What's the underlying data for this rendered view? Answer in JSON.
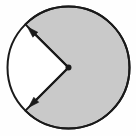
{
  "figure": {
    "type": "geometry-diagram",
    "canvas": {
      "width": 136,
      "height": 136,
      "background_color": "#fefefe"
    },
    "circle": {
      "name": "circle-outline",
      "center_x": 68.5,
      "center_y": 67.5,
      "radius": 61.0,
      "stroke_color": "#1a1a1a",
      "stroke_width": 2.0,
      "fill_color": "#ffffff"
    },
    "shaded_sector": {
      "name": "shaded-reflex-sector",
      "fill_color": "#c9c9c9",
      "stroke_color": "#1a1a1a",
      "stroke_width": 2.0,
      "start_angle_deg": 135,
      "end_angle_deg": 225,
      "sweep_deg": 270,
      "description": "major (reflex) sector swept clockwise from the upper-left radius through the right side to the lower-left radius"
    },
    "unshaded_sector": {
      "name": "unshaded-minor-sector",
      "fill_color": "#ffffff",
      "sweep_deg": 90,
      "description": "minor wedge on the left between the two arrows"
    },
    "center_point": {
      "name": "center-vertex-dot",
      "x": 68.5,
      "y": 67.5,
      "radius": 3.0,
      "color": "#1a1a1a"
    },
    "arrows": [
      {
        "name": "radius-arrow-upper-left",
        "from_x": 68.5,
        "from_y": 67.5,
        "to_x": 27.5,
        "to_y": 27.0,
        "angle_deg": 135,
        "color": "#1a1a1a",
        "stroke_width": 2.0,
        "head_length": 11,
        "head_width": 7
      },
      {
        "name": "radius-arrow-lower-left",
        "from_x": 68.5,
        "from_y": 67.5,
        "to_x": 28.5,
        "to_y": 107.5,
        "angle_deg": 225,
        "color": "#1a1a1a",
        "stroke_width": 2.0,
        "head_length": 11,
        "head_width": 7
      }
    ],
    "labels": {
      "angle_label": "",
      "center_label": "",
      "caption": ""
    }
  }
}
